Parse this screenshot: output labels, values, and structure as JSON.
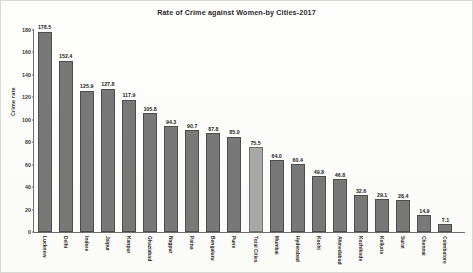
{
  "chart_data": {
    "type": "bar",
    "title": "Rate of Crime against Women-by Cities-2017",
    "xlabel": "",
    "ylabel": "Crime rate",
    "ylim": [
      0,
      180
    ],
    "ytick_step": 20,
    "yticks": [
      "0",
      "20",
      "40",
      "60",
      "80",
      "100",
      "120",
      "140",
      "160",
      "180"
    ],
    "grid": false,
    "legend": "none",
    "orientation": "vertical",
    "bar_color": "#787878",
    "highlight_color": "#a8a8a8",
    "highlight_category": "Total Cities",
    "categories": [
      "Lucknow",
      "Delhi",
      "Indore",
      "Jaipur",
      "Kanpur",
      "Ghaziabad",
      "Nagpur",
      "Patna",
      "Bengaluru",
      "Pune",
      "Total Cities",
      "Mumbai",
      "Hyderabad",
      "Kochi",
      "Ahmedabad",
      "Kozhikode",
      "Kolkata",
      "Surat",
      "Chennai",
      "Coimbatore"
    ],
    "values": [
      178.5,
      152.4,
      125.9,
      127.8,
      117.9,
      105.8,
      94.3,
      90.7,
      87.8,
      85.0,
      75.5,
      64.0,
      60.4,
      49.8,
      46.8,
      32.6,
      29.1,
      28.4,
      14.9,
      7.1
    ],
    "value_labels": [
      "178.5",
      "152.4",
      "125.9",
      "127.8",
      "117.9",
      "105.8",
      "94.3",
      "90.7",
      "87.8",
      "85.0",
      "75.5",
      "64.0",
      "60.4",
      "49.8",
      "46.8",
      "32.6",
      "29.1",
      "28.4",
      "14.9",
      "7.1"
    ]
  }
}
